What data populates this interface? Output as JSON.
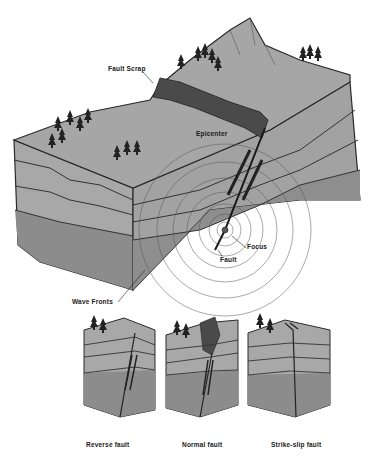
{
  "diagram": {
    "main_labels": {
      "fault_scrap": "Fault Scrap",
      "epicenter": "Epicenter",
      "focus": "Focus",
      "fault": "Fault",
      "wave_fronts": "Wave Fronts"
    },
    "fault_types": [
      {
        "label": "Reverse fault"
      },
      {
        "label": "Normal fault"
      },
      {
        "label": "Strike-slip fault"
      }
    ],
    "colors": {
      "surface": "#a6a6a6",
      "layer_light": "#b4b4b4",
      "layer_mid": "#9e9e9e",
      "layer_dark": "#8a8a8a",
      "scarp": "#4a4a4a",
      "outline": "#2a2a2a",
      "tree": "#222222"
    }
  }
}
